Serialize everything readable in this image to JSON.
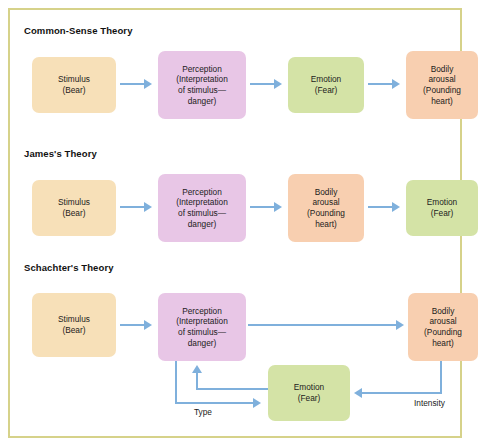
{
  "figure": {
    "frame_color": "#d6d28a",
    "arrow_color": "#7fb0dc",
    "background": "#ffffff"
  },
  "palette": {
    "stimulus": "#f7e0b8",
    "perception": "#e8c6e6",
    "emotion": "#d4e3a6",
    "arousal": "#f8cfb0"
  },
  "labels": {
    "stimulus": "Stimulus\n(Bear)",
    "stimulus_line1": "Stimulus",
    "stimulus_line2": "(Bear)",
    "perception_line1": "Perception",
    "perception_line2": "(Interpretation",
    "perception_line3": "of stimulus—",
    "perception_line4": "danger)",
    "emotion_line1": "Emotion",
    "emotion_line2": "(Fear)",
    "arousal_line1": "Bodily",
    "arousal_line2": "arousal",
    "arousal_line3": "(Pounding",
    "arousal_line4": "heart)",
    "type": "Type",
    "intensity": "Intensity"
  },
  "sections": [
    {
      "id": "common-sense",
      "title": "Common-Sense Theory",
      "sequence": [
        "Stimulus (Bear)",
        "Perception (Interpretation of stimulus—danger)",
        "Emotion (Fear)",
        "Bodily arousal (Pounding heart)"
      ]
    },
    {
      "id": "james",
      "title": "James's Theory",
      "sequence": [
        "Stimulus (Bear)",
        "Perception (Interpretation of stimulus—danger)",
        "Bodily arousal (Pounding heart)",
        "Emotion (Fear)"
      ]
    },
    {
      "id": "schachter",
      "title": "Schachter's Theory",
      "sequence": [
        "Stimulus (Bear)",
        "Perception (Interpretation of stimulus—danger)",
        "Bodily arousal (Pounding heart)",
        "Emotion (Fear)"
      ],
      "edge_labels": [
        "Type",
        "Intensity"
      ]
    }
  ]
}
